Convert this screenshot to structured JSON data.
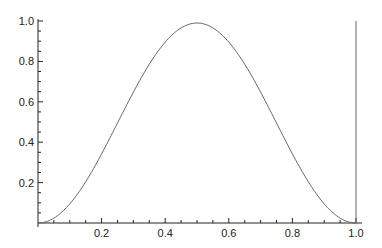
{
  "chart_data": {
    "type": "line",
    "title": "",
    "xlabel": "",
    "ylabel": "",
    "xlim": [
      0,
      1.0
    ],
    "ylim": [
      0,
      1.0
    ],
    "grid": false,
    "legend": null,
    "x_ticks": [
      "0.2",
      "0.4",
      "0.6",
      "0.8",
      "1.0"
    ],
    "y_ticks": [
      "0.2",
      "0.4",
      "0.6",
      "0.8",
      "1.0"
    ],
    "series": [
      {
        "name": "curve",
        "function": "sin^2(pi x)",
        "x": [
          0,
          0.05,
          0.1,
          0.15,
          0.2,
          0.25,
          0.3,
          0.35,
          0.4,
          0.45,
          0.5,
          0.55,
          0.6,
          0.65,
          0.7,
          0.75,
          0.8,
          0.85,
          0.9,
          0.95,
          1.0
        ],
        "values": [
          0,
          0.024,
          0.095,
          0.206,
          0.345,
          0.5,
          0.655,
          0.794,
          0.905,
          0.976,
          0.99,
          0.976,
          0.905,
          0.794,
          0.655,
          0.5,
          0.345,
          0.206,
          0.095,
          0.024,
          0
        ]
      }
    ],
    "annotations": [
      {
        "type": "vertical_line",
        "x": 1.0,
        "from": 0,
        "to": 1.0
      }
    ],
    "colors": {
      "curve": "#666666",
      "axes": "#222222"
    }
  }
}
